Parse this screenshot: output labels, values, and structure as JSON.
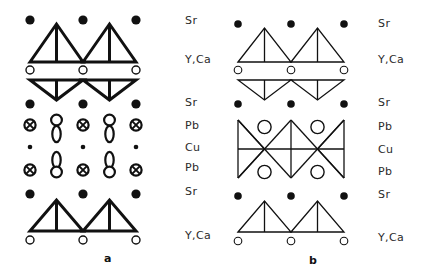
{
  "figure": {
    "title": "",
    "background": "#ffffff",
    "ink": "#111111",
    "panels": [
      {
        "id": "a",
        "caption": "a",
        "stroke_weight": "thick",
        "origin_x": 18,
        "columns_x": [
          30,
          83,
          136
        ],
        "labels_x": 185,
        "rows": [
          {
            "name": "Sr",
            "label": "Sr",
            "y": 20,
            "marker": "filled-circle"
          },
          {
            "name": "YCa",
            "label": "Y,Ca",
            "y": 70,
            "marker": "open-circle"
          },
          {
            "name": "Sr2",
            "label": "Sr",
            "y": 104,
            "marker": "filled-circle"
          },
          {
            "name": "Pb",
            "label": "Pb",
            "y": 124,
            "marker": "crossed-circle"
          },
          {
            "name": "Cu",
            "label": "Cu",
            "y": 146,
            "marker": "small-dot"
          },
          {
            "name": "Pb2",
            "label": "Pb",
            "y": 168,
            "marker": "crossed-circle"
          },
          {
            "name": "Sr3",
            "label": "Sr",
            "y": 193,
            "marker": "filled-circle"
          },
          {
            "name": "YCa2",
            "label": "Y,Ca",
            "y": 238,
            "marker": "open-circle"
          }
        ]
      },
      {
        "id": "b",
        "caption": "b",
        "stroke_weight": "thin",
        "origin_x": 228,
        "columns_x": [
          238,
          291,
          344
        ],
        "labels_x": 378,
        "rows": [
          {
            "name": "Sr",
            "label": "Sr",
            "y": 24,
            "marker": "filled-circle"
          },
          {
            "name": "YCa",
            "label": "Y,Ca",
            "y": 70,
            "marker": "open-circle"
          },
          {
            "name": "Sr2",
            "label": "Sr",
            "y": 104,
            "marker": "filled-circle"
          },
          {
            "name": "Pb",
            "label": "Pb",
            "y": 127,
            "marker": "large-open-circle"
          },
          {
            "name": "Cu",
            "label": "Cu",
            "y": 150,
            "marker": "line-node"
          },
          {
            "name": "Pb2",
            "label": "Pb",
            "y": 172,
            "marker": "large-open-circle"
          },
          {
            "name": "Sr3",
            "label": "Sr",
            "y": 196,
            "marker": "filled-circle"
          },
          {
            "name": "YCa2",
            "label": "Y,Ca",
            "y": 240,
            "marker": "open-circle"
          }
        ]
      }
    ],
    "legend_labels": [
      "Sr",
      "Y,Ca",
      "Sr",
      "Pb",
      "Cu",
      "Pb",
      "Sr",
      "Y,Ca"
    ],
    "markers": {
      "filled-circle": "Sr site (filled dot)",
      "open-circle": "Y,Ca site (open circle)",
      "crossed-circle": "Pb site (circle with cross)",
      "small-dot": "Cu site (small dot)",
      "large-open-circle": "Pb site (large open circle)",
      "line-node": "Cu site (line node)"
    }
  }
}
